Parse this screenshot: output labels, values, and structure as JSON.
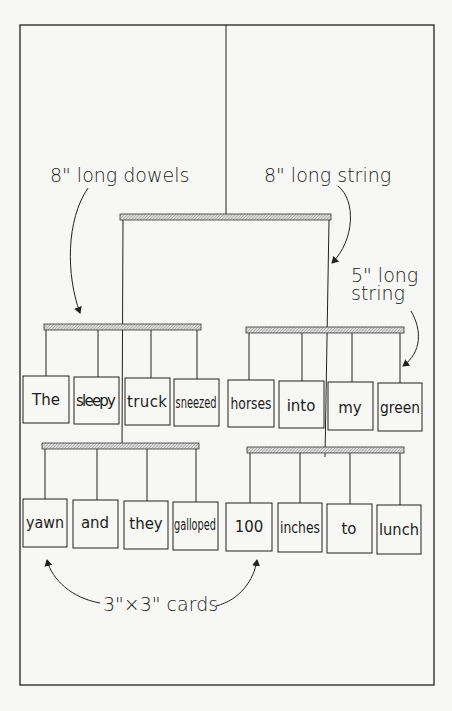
{
  "diagram": {
    "colors": {
      "ink": "#222222",
      "paper": "#f7f7f5",
      "dowel_fill": "#cfcfcf"
    },
    "annotations": {
      "dowels": "8\" long dowels",
      "long_string": "8\" long string",
      "short_string_line1": "5\" long",
      "short_string_line2": "string",
      "cards": "3\"×3\" cards"
    },
    "rows": [
      {
        "name": "upper",
        "cards": [
          "The",
          "sleepy",
          "truck",
          "sneezed",
          "horses",
          "into",
          "my",
          "green"
        ]
      },
      {
        "name": "lower",
        "cards": [
          "yawn",
          "and",
          "they",
          "galloped",
          "100",
          "inches",
          "to",
          "lunch"
        ]
      }
    ]
  }
}
